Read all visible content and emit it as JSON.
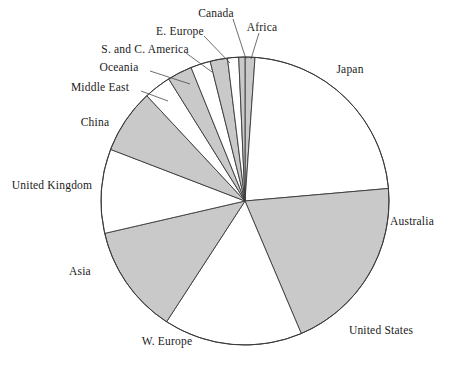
{
  "chart_data": {
    "type": "pie",
    "title": "",
    "subtitle": "",
    "xlabel": "",
    "ylabel": "",
    "legend_position": "none",
    "grid": false,
    "labels_position": "outside-with-leader-lines",
    "start_angle_deg": -90,
    "direction": "clockwise",
    "categories": [
      "Africa",
      "Japan",
      "Australia",
      "United States",
      "W. Europe",
      "Asia",
      "United Kingdom",
      "China",
      "Middle East",
      "Oceania",
      "S. and C. America",
      "E. Europe",
      "Canada"
    ],
    "values": [
      1.1,
      22.5,
      20.0,
      15.5,
      12.2,
      9.4,
      7.2,
      3.1,
      2.8,
      2.2,
      1.9,
      1.3,
      0.8
    ],
    "slices": [
      {
        "label": "Africa",
        "value": 1.1,
        "fill": "#c9c9c9",
        "start_deg": 0.0,
        "end_deg": 4.0
      },
      {
        "label": "Japan",
        "value": 22.5,
        "fill": "#ffffff",
        "start_deg": 4.0,
        "end_deg": 85.0
      },
      {
        "label": "Australia",
        "value": 20.0,
        "fill": "#c9c9c9",
        "start_deg": 85.0,
        "end_deg": 157.0
      },
      {
        "label": "United States",
        "value": 15.5,
        "fill": "#ffffff",
        "start_deg": 157.0,
        "end_deg": 213.0
      },
      {
        "label": "W. Europe",
        "value": 12.2,
        "fill": "#c9c9c9",
        "start_deg": 213.0,
        "end_deg": 257.0
      },
      {
        "label": "Asia",
        "value": 9.4,
        "fill": "#ffffff",
        "start_deg": 257.0,
        "end_deg": 291.0
      },
      {
        "label": "United Kingdom",
        "value": 7.2,
        "fill": "#c9c9c9",
        "start_deg": 291.0,
        "end_deg": 317.0
      },
      {
        "label": "China",
        "value": 3.1,
        "fill": "#ffffff",
        "start_deg": 317.0,
        "end_deg": 328.0
      },
      {
        "label": "Middle East",
        "value": 2.8,
        "fill": "#c9c9c9",
        "start_deg": 328.0,
        "end_deg": 338.0
      },
      {
        "label": "Oceania",
        "value": 2.2,
        "fill": "#ffffff",
        "start_deg": 338.0,
        "end_deg": 346.0
      },
      {
        "label": "S. and C. America",
        "value": 1.9,
        "fill": "#c9c9c9",
        "start_deg": 346.0,
        "end_deg": 353.0
      },
      {
        "label": "E. Europe",
        "value": 1.3,
        "fill": "#ffffff",
        "start_deg": 353.0,
        "end_deg": 357.5
      },
      {
        "label": "Canada",
        "value": 0.8,
        "fill": "#c9c9c9",
        "start_deg": 357.5,
        "end_deg": 360.0
      }
    ]
  },
  "geometry": {
    "cx": 245,
    "cy": 201,
    "r": 144
  },
  "colors": {
    "shaded_slice": "#c9c9c9",
    "empty_slice": "#ffffff",
    "outline": "#3a3a3a",
    "text": "#1a1a1a",
    "background": "#ffffff"
  },
  "labels": [
    {
      "text": "Canada",
      "x": 216,
      "y": 14,
      "anchor": "middle",
      "leader": {
        "x1": 233,
        "y1": 19,
        "x2": 246,
        "y2": 59
      }
    },
    {
      "text": "Africa",
      "x": 262,
      "y": 28,
      "anchor": "middle",
      "leader": {
        "x1": 259,
        "y1": 33,
        "x2": 251,
        "y2": 59
      }
    },
    {
      "text": "E. Europe",
      "x": 180,
      "y": 32,
      "anchor": "middle",
      "leader": {
        "x1": 204,
        "y1": 36,
        "x2": 230,
        "y2": 63
      }
    },
    {
      "text": "S. and C. America",
      "x": 145,
      "y": 50,
      "anchor": "middle",
      "leader": {
        "x1": 186,
        "y1": 53,
        "x2": 212,
        "y2": 72
      }
    },
    {
      "text": "Oceania",
      "x": 119,
      "y": 68,
      "anchor": "middle",
      "leader": {
        "x1": 150,
        "y1": 71,
        "x2": 190,
        "y2": 84
      }
    },
    {
      "text": "Middle East",
      "x": 100,
      "y": 88,
      "anchor": "middle",
      "leader": {
        "x1": 141,
        "y1": 91,
        "x2": 168,
        "y2": 101
      }
    },
    {
      "text": "China",
      "x": 95,
      "y": 123,
      "anchor": "middle",
      "leader": null
    },
    {
      "text": "United Kingdom",
      "x": 52,
      "y": 186,
      "anchor": "middle",
      "leader": null
    },
    {
      "text": "Asia",
      "x": 80,
      "y": 272,
      "anchor": "middle",
      "leader": null
    },
    {
      "text": "W. Europe",
      "x": 167,
      "y": 342,
      "anchor": "middle",
      "leader": null
    },
    {
      "text": "United States",
      "x": 381,
      "y": 331,
      "anchor": "middle",
      "leader": null
    },
    {
      "text": "Australia",
      "x": 412,
      "y": 222,
      "anchor": "middle",
      "leader": null
    },
    {
      "text": "Japan",
      "x": 350,
      "y": 70,
      "anchor": "middle",
      "leader": null
    }
  ]
}
